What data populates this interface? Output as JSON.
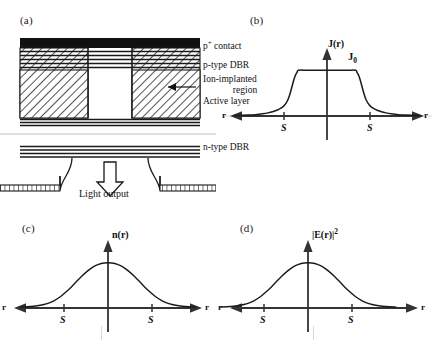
{
  "figure": {
    "panels": [
      {
        "tag": "(a)",
        "kind": "device-cross-section"
      },
      {
        "tag": "(b)",
        "kind": "plot"
      },
      {
        "tag": "(c)",
        "kind": "plot"
      },
      {
        "tag": "(d)",
        "kind": "plot"
      }
    ]
  },
  "device": {
    "labels": {
      "p_contact": "p",
      "p_contact_sup": "+",
      "p_contact_rest": " contact",
      "p_dbr": "p-type DBR",
      "implant_line1": "Ion-implanted",
      "implant_line2": "region",
      "active": "Active layer",
      "n_dbr": "n-type DBR",
      "light_output": "Light output"
    },
    "colors": {
      "contact_fill": "#111111",
      "hatch_stroke": "#1a1a1a",
      "dbr_stroke": "#1a1a1a",
      "outline": "#1a1a1a"
    }
  },
  "chart_data": [
    {
      "id": "b",
      "type": "line",
      "title": "J(r)",
      "panel_tag": "(b)",
      "xlabel": "r",
      "ylabel": "J(r)",
      "x_left_label": "r",
      "x_right_label": "r",
      "tick_labels": [
        "S",
        "S"
      ],
      "tick_x": [
        -1,
        1
      ],
      "annotations": [
        {
          "text": "J",
          "sub": "0",
          "x": 0.28,
          "y": 1.0
        }
      ],
      "description": "Current density profile: flat plateau at J0 across the implant aperture with steep shoulders decaying outside +/- S",
      "xlim": [
        -2.6,
        2.6
      ],
      "ylim": [
        0,
        1.18
      ],
      "grid": false,
      "legend": false,
      "x": [
        -2.6,
        -2.4,
        -2.2,
        -2.0,
        -1.8,
        -1.65,
        -1.5,
        -1.4,
        -1.3,
        -1.22,
        -1.15,
        -1.09,
        -1.04,
        -1.0,
        -0.96,
        -0.92,
        -0.88,
        -0.84,
        -0.8,
        -0.6,
        -0.4,
        -0.2,
        0.0,
        0.2,
        0.4,
        0.6,
        0.8,
        0.84,
        0.88,
        0.92,
        0.96,
        1.0,
        1.04,
        1.09,
        1.15,
        1.22,
        1.3,
        1.4,
        1.5,
        1.65,
        1.8,
        2.0,
        2.2,
        2.4,
        2.6
      ],
      "y": [
        0.01,
        0.014,
        0.02,
        0.03,
        0.048,
        0.068,
        0.098,
        0.125,
        0.165,
        0.21,
        0.275,
        0.36,
        0.47,
        0.58,
        0.7,
        0.81,
        0.895,
        0.95,
        1.0,
        1.0,
        1.0,
        1.0,
        1.0,
        1.0,
        1.0,
        1.0,
        1.0,
        0.95,
        0.895,
        0.81,
        0.7,
        0.58,
        0.47,
        0.36,
        0.275,
        0.21,
        0.165,
        0.125,
        0.098,
        0.068,
        0.048,
        0.03,
        0.02,
        0.014,
        0.01
      ]
    },
    {
      "id": "c",
      "type": "line",
      "title": "n(r)",
      "panel_tag": "(c)",
      "xlabel": "r",
      "ylabel": "n(r)",
      "x_left_label": "r",
      "x_right_label": "r",
      "tick_labels": [
        "S",
        "S"
      ],
      "tick_x": [
        -1,
        1
      ],
      "annotations": [],
      "description": "Carrier density profile: smooth bell-shaped (Gaussian-like) distribution peaking on axis and decaying beyond +/- S due to lateral carrier diffusion",
      "xlim": [
        -2.6,
        2.6
      ],
      "ylim": [
        0,
        1.15
      ],
      "grid": false,
      "legend": false,
      "x": [
        -2.6,
        -2.4,
        -2.2,
        -2.0,
        -1.8,
        -1.6,
        -1.4,
        -1.2,
        -1.0,
        -0.8,
        -0.6,
        -0.4,
        -0.2,
        0.0,
        0.2,
        0.4,
        0.6,
        0.8,
        1.0,
        1.2,
        1.4,
        1.6,
        1.8,
        2.0,
        2.2,
        2.4,
        2.6
      ],
      "y": [
        0.02,
        0.026,
        0.038,
        0.06,
        0.098,
        0.16,
        0.255,
        0.38,
        0.53,
        0.685,
        0.82,
        0.925,
        0.985,
        1.0,
        0.985,
        0.925,
        0.82,
        0.685,
        0.53,
        0.38,
        0.255,
        0.16,
        0.098,
        0.06,
        0.038,
        0.026,
        0.02
      ]
    },
    {
      "id": "d",
      "type": "line",
      "title": "|E(r)|^2",
      "panel_tag": "(d)",
      "xlabel": "r",
      "ylabel": "|E(r)|^2",
      "x_left_label": "r",
      "x_right_label": "r",
      "tick_labels": [
        "S",
        "S"
      ],
      "tick_x": [
        -1,
        1
      ],
      "annotations": [],
      "description": "Optical field intensity profile: fundamental-mode Gaussian intensity distribution peaking on axis, extending beyond +/- S",
      "xlim": [
        -2.6,
        2.6
      ],
      "ylim": [
        0,
        1.15
      ],
      "grid": false,
      "legend": false,
      "x": [
        -2.6,
        -2.4,
        -2.2,
        -2.0,
        -1.8,
        -1.6,
        -1.4,
        -1.2,
        -1.0,
        -0.8,
        -0.6,
        -0.4,
        -0.2,
        0.0,
        0.2,
        0.4,
        0.6,
        0.8,
        1.0,
        1.2,
        1.4,
        1.6,
        1.8,
        2.0,
        2.2,
        2.4,
        2.6
      ],
      "y": [
        0.02,
        0.026,
        0.038,
        0.06,
        0.098,
        0.16,
        0.255,
        0.38,
        0.53,
        0.685,
        0.82,
        0.925,
        0.985,
        1.0,
        0.985,
        0.925,
        0.82,
        0.685,
        0.53,
        0.38,
        0.255,
        0.16,
        0.098,
        0.06,
        0.038,
        0.026,
        0.02
      ]
    }
  ]
}
